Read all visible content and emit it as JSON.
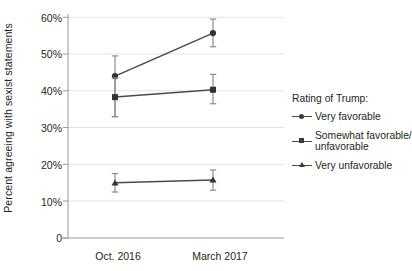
{
  "chart_data": {
    "type": "line",
    "title": "",
    "subtitle": "",
    "xlabel": "",
    "ylabel": "Percent agreeing with sexist statements",
    "categories": [
      "Oct. 2016",
      "March 2017"
    ],
    "ylim": [
      0,
      60
    ],
    "ytick_labels": [
      "60%",
      "50%",
      "40%",
      "30%",
      "20%",
      "10%",
      "0"
    ],
    "ytick_values": [
      60,
      50,
      40,
      30,
      20,
      10,
      0
    ],
    "grid": true,
    "legend_position": "right",
    "legend_title": "Rating of Trump:",
    "series": [
      {
        "name": "Very favorable",
        "marker": "circle",
        "values": [
          44.0,
          55.7
        ],
        "err_low": [
          33.0,
          52.0
        ],
        "err_high": [
          49.5,
          59.5
        ]
      },
      {
        "name": "Somewhat favorable/ unfavorable",
        "marker": "square",
        "values": [
          38.3,
          40.3
        ],
        "err_low": [
          33.0,
          36.5
        ],
        "err_high": [
          43.5,
          44.5
        ]
      },
      {
        "name": "Very unfavorable",
        "marker": "triangle",
        "values": [
          15.0,
          15.8
        ],
        "err_low": [
          12.5,
          13.0
        ],
        "err_high": [
          17.5,
          18.5
        ]
      }
    ],
    "colors": {
      "series_line": "#4a4a4a",
      "marker": "#333333",
      "grid": "#e3e3e3",
      "axis": "#9a9a9a",
      "text": "#231f20"
    }
  },
  "legend": {
    "title": "Rating of Trump:",
    "items": [
      {
        "label": "Very favorable"
      },
      {
        "label": "Somewhat favorable/ unfavorable"
      },
      {
        "label": "Very unfavorable"
      }
    ]
  },
  "axes": {
    "y_label": "Percent agreeing with sexist statements",
    "y_ticks": [
      "60%",
      "50%",
      "40%",
      "30%",
      "20%",
      "10%",
      "0"
    ],
    "x_ticks": [
      "Oct. 2016",
      "March 2017"
    ]
  }
}
